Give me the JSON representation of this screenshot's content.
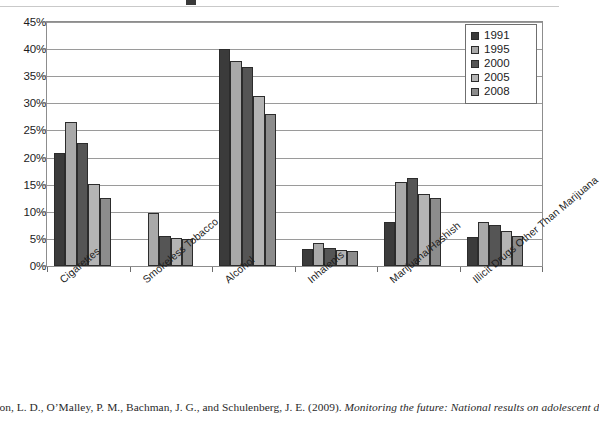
{
  "chart_data": {
    "type": "bar",
    "title": "",
    "xlabel": "",
    "ylabel": "",
    "ylim": [
      0,
      45
    ],
    "ytick_labels": [
      "45%",
      "40%",
      "35%",
      "30%",
      "25%",
      "20%",
      "15%",
      "10%",
      "5%",
      "0%"
    ],
    "ytick_values": [
      45,
      40,
      35,
      30,
      25,
      20,
      15,
      10,
      5,
      0
    ],
    "grid": true,
    "legend_position": "top-right",
    "categories": [
      "Cigarettes",
      "Smokeless Tobacco",
      "Alcohol",
      "Inhalents",
      "Marijuana/Hashish",
      "Illicit Drugs Other Than Marijuana"
    ],
    "series": [
      {
        "name": "1991",
        "color": "#3b3b3b",
        "values": [
          20.8,
          null,
          40.0,
          3.2,
          8.2,
          5.3
        ]
      },
      {
        "name": "1995",
        "color": "#a9a9a9",
        "values": [
          26.6,
          9.7,
          37.9,
          4.3,
          15.5,
          8.2
        ]
      },
      {
        "name": "2000",
        "color": "#555555",
        "values": [
          22.6,
          5.5,
          36.7,
          3.4,
          16.2,
          7.5
        ]
      },
      {
        "name": "2005",
        "color": "#b4b4b4",
        "values": [
          15.2,
          5.2,
          31.3,
          2.9,
          13.3,
          6.4
        ]
      },
      {
        "name": "2008",
        "color": "#8c8c8c",
        "values": [
          12.6,
          4.9,
          28.0,
          2.7,
          12.5,
          5.5
        ]
      }
    ]
  },
  "legend": {
    "items": [
      {
        "label": "1991"
      },
      {
        "label": "1995"
      },
      {
        "label": "2000"
      },
      {
        "label": "2005"
      },
      {
        "label": "2008"
      }
    ]
  },
  "caption": {
    "prefix": "nston, L. D., O’Malley, P. M., Bachman, J. G., and Schulenberg, J. E. (2009). ",
    "italic": "Monitoring the future: National results on adolescent d"
  }
}
